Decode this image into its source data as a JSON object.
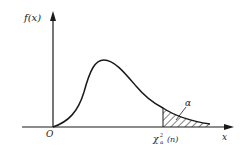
{
  "figure": {
    "type": "chi-square density with upper-tail critical region",
    "labels": {
      "y_axis": "f(x)",
      "x_axis": "x",
      "origin": "O",
      "critical_value": "χ²α(n)",
      "critical_value_base": "χ",
      "critical_value_sup": "2",
      "critical_value_sub": "α",
      "critical_value_arg": "(n)",
      "tail_area": "α"
    },
    "colors": {
      "line": "#1a1a1a",
      "background": "#ffffff"
    }
  }
}
